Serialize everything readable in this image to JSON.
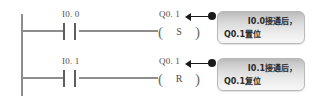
{
  "diagram": {
    "type": "plc-ladder-logic",
    "title": "",
    "colors": {
      "rail": "#8d8d8d",
      "symbol": "#5d5d5d",
      "text": "#4d4d4d",
      "leader": "#1a1a1a",
      "callout_border": "#b9b9b9",
      "callout_fill_top": "#b9b9b9",
      "callout_fill_bottom": "#f7f7f7",
      "background": "#ffffff"
    },
    "rungs": [
      {
        "id": "rung-1",
        "contact": {
          "label": "I0. 0",
          "type": "normally-open"
        },
        "coil": {
          "label": "Q0. 1",
          "letter": "S",
          "type": "set-coil",
          "paren_left": "(",
          "paren_right": ")"
        },
        "callout": {
          "line1": "I0.0接通后，",
          "line2": "Q0.1置位"
        }
      },
      {
        "id": "rung-2",
        "contact": {
          "label": "I0. 1",
          "type": "normally-open"
        },
        "coil": {
          "label": "Q0. 1",
          "letter": "R",
          "type": "reset-coil",
          "paren_left": "(",
          "paren_right": ")"
        },
        "callout": {
          "line1": "I0.1接通后，",
          "line2": "Q0.1复位"
        }
      }
    ]
  }
}
